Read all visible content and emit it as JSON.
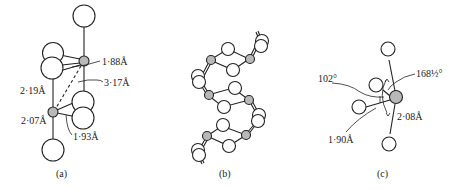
{
  "figure": {
    "panels": [
      {
        "id": "a",
        "caption": "(a)",
        "labels": {
          "d1": "1·88Å",
          "d2": "3·17Å",
          "d3": "2·19Å",
          "d4": "2·07Å",
          "d5": "1·93Å"
        }
      },
      {
        "id": "b",
        "caption": "(b)"
      },
      {
        "id": "c",
        "caption": "(c)",
        "labels": {
          "angle1": "102°",
          "angle2": "168½°",
          "d1": "2·08Å",
          "d2": "1·90Å"
        }
      }
    ]
  },
  "colors": {
    "metal_atom": "#b8b8b8",
    "open_atom": "#ffffff",
    "line": "#222222"
  }
}
